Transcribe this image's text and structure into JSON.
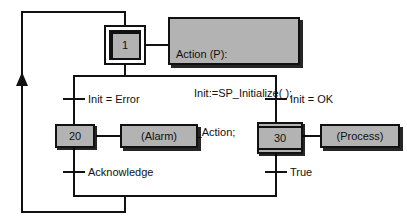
{
  "diagram": {
    "type": "sequential-function-chart",
    "title": "",
    "colors": {
      "line": "#111111",
      "block_fill": "#b3b3b3",
      "block_border": "#111111",
      "background": "#ffffff"
    },
    "initial_step": {
      "id": "1",
      "kind": "initial-step"
    },
    "initial_action": {
      "kind": "action-block",
      "lines": [
        "Action (P):",
        "Init:=SP_Initialize( );",
        "End_Action;"
      ],
      "line1": "Action (P):",
      "line2": "Init:=SP_Initialize( );",
      "line3": "End_Action;"
    },
    "branches": [
      {
        "side": "left",
        "transition_in": "Init = Error",
        "step": {
          "id": "20",
          "kind": "step"
        },
        "action": "(Alarm)",
        "transition_out": "Acknowledge"
      },
      {
        "side": "right",
        "transition_in": "Init = OK",
        "step": {
          "id": "30",
          "kind": "macro-step"
        },
        "action": "(Process)",
        "transition_out": "True"
      }
    ],
    "return_loop": {
      "label": "",
      "arrow": "up-arrow-icon"
    }
  }
}
